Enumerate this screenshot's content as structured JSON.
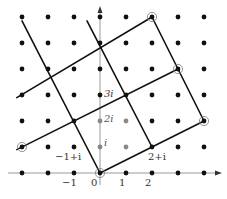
{
  "diagram": {
    "type": "gaussian-integer-lattice",
    "origin_px": [
      100,
      173
    ],
    "spacing_px": 26,
    "grid": {
      "x_range": [
        -3,
        4
      ],
      "y_range": [
        0,
        6
      ]
    },
    "colors": {
      "dot": "#111111",
      "gray_dot": "#888888",
      "line": "#111111",
      "axis": "#999999"
    },
    "gray_points": [
      [
        0,
        1
      ],
      [
        0,
        2
      ],
      [
        1,
        1
      ],
      [
        1,
        2
      ]
    ],
    "circled_points": [
      [
        0,
        0
      ],
      [
        -3,
        1
      ],
      [
        2,
        6
      ],
      [
        3,
        4
      ],
      [
        4,
        2
      ]
    ],
    "lines": [
      {
        "from": [
          -3.2,
          0.9
        ],
        "to": [
          3,
          4
        ],
        "label": "line-a"
      },
      {
        "from": [
          -3.2,
          2.9
        ],
        "to": [
          2,
          6
        ],
        "label": "line-b"
      },
      {
        "from": [
          0,
          0
        ],
        "to": [
          4,
          2
        ],
        "label": "line-c"
      },
      {
        "from": [
          -3,
          5.85
        ],
        "to": [
          0,
          0
        ],
        "label": "line-d"
      },
      {
        "from": [
          -0.5,
          5.85
        ],
        "to": [
          2,
          1
        ],
        "label": "line-e"
      },
      {
        "from": [
          2,
          6
        ],
        "to": [
          4,
          2
        ],
        "label": "line-f"
      }
    ],
    "axis_labels": {
      "x_ticks": [
        {
          "text": "−1",
          "x": -1
        },
        {
          "text": "0",
          "x": 0
        },
        {
          "text": "1",
          "x": 1
        },
        {
          "text": "2",
          "x": 2
        }
      ],
      "y_ticks": [
        {
          "text": "i",
          "y": 1
        },
        {
          "text": "2i",
          "y": 2
        },
        {
          "text": "3i",
          "y": 3
        }
      ]
    },
    "point_labels": [
      {
        "text": "−1+i",
        "at": [
          -1,
          1
        ]
      },
      {
        "text": "2+i",
        "at": [
          2,
          1
        ]
      }
    ]
  }
}
